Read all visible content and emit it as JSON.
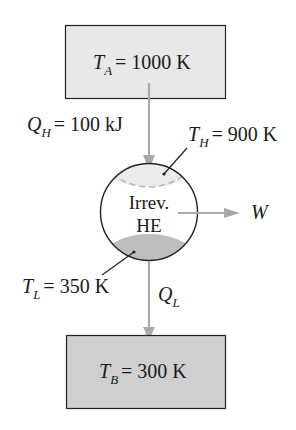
{
  "diagram": {
    "source_reservoir": {
      "symbol": "T",
      "subscript": "A",
      "value": "= 1000 K",
      "fill": "#e8e8e8"
    },
    "sink_reservoir": {
      "symbol": "T",
      "subscript": "B",
      "value": "= 300 K",
      "fill": "#cfcfcf"
    },
    "heat_in": {
      "symbol": "Q",
      "subscript": "H",
      "value": "= 100 kJ"
    },
    "heat_out": {
      "symbol": "Q",
      "subscript": "L",
      "value": ""
    },
    "work": {
      "symbol": "W"
    },
    "hot_side_temp": {
      "symbol": "T",
      "subscript": "H",
      "value": "= 900 K",
      "fill": "#ececec"
    },
    "cold_side_temp": {
      "symbol": "T",
      "subscript": "L",
      "value": "= 350 K",
      "fill": "#bdbdbd"
    },
    "engine": {
      "line1": "Irrev.",
      "line2": "HE"
    },
    "arrow_color": "#a9a9a9"
  }
}
